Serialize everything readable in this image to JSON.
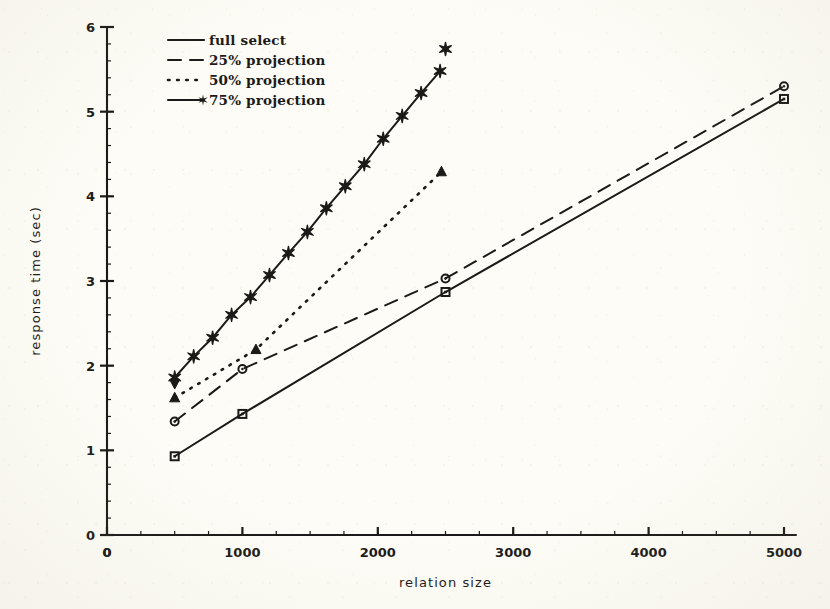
{
  "figure": {
    "background_color": "#fdfcf6",
    "ink_color": "#1c1a18"
  },
  "axes": {
    "x_label": "relation size",
    "y_label": "response time (sec)",
    "x_ticks": [
      "0",
      "1000",
      "2000",
      "3000",
      "4000",
      "5000"
    ],
    "y_ticks": [
      "0",
      "1",
      "2",
      "3",
      "4",
      "5",
      "6"
    ],
    "x_origin_label": "0",
    "y_origin_label": "0"
  },
  "legend": {
    "items": [
      {
        "label": "full select",
        "style": "solid",
        "marker": "none"
      },
      {
        "label": "25% projection",
        "style": "dashed",
        "marker": "none"
      },
      {
        "label": "50% projection",
        "style": "dotted",
        "marker": "none"
      },
      {
        "label": "75% projection",
        "style": "solid",
        "marker": "star"
      }
    ]
  },
  "chart_data": {
    "type": "line",
    "title": "",
    "xlabel": "relation size",
    "ylabel": "response time (sec)",
    "xlim": [
      0,
      5000
    ],
    "ylim": [
      0,
      6
    ],
    "xticks": [
      0,
      1000,
      2000,
      3000,
      4000,
      5000
    ],
    "yticks": [
      0,
      1,
      2,
      3,
      4,
      5,
      6
    ],
    "x_minor_tick_step": 250,
    "y_minor_tick_step": 0.2,
    "grid": false,
    "legend_position": "top-left",
    "series": [
      {
        "name": "full select",
        "line_style": "solid",
        "marker": "square",
        "x": [
          500,
          1000,
          2500,
          5000
        ],
        "y": [
          0.93,
          1.43,
          2.87,
          5.15
        ]
      },
      {
        "name": "25% projection",
        "line_style": "dashed",
        "marker": "circle",
        "x": [
          500,
          1000,
          2500,
          5000
        ],
        "y": [
          1.34,
          1.96,
          3.03,
          5.3
        ]
      },
      {
        "name": "50% projection",
        "line_style": "dotted",
        "marker": "triangle-up",
        "x": [
          500,
          1100,
          2470
        ],
        "y": [
          1.62,
          2.19,
          4.29
        ]
      },
      {
        "name": "75% projection",
        "line_style": "solid",
        "marker": "star",
        "x": [
          500,
          640,
          780,
          920,
          1060,
          1200,
          1340,
          1480,
          1620,
          1760,
          1900,
          2040,
          2180,
          2320,
          2460
        ],
        "y": [
          1.86,
          2.11,
          2.33,
          2.6,
          2.81,
          3.07,
          3.33,
          3.58,
          3.86,
          4.12,
          4.38,
          4.68,
          4.95,
          5.22,
          5.48
        ]
      },
      {
        "name": "75% projection start cap",
        "line_style": "none",
        "marker": "triangle-down",
        "x": [
          500
        ],
        "y": [
          1.79
        ]
      },
      {
        "name": "75% projection end cap",
        "line_style": "none",
        "marker": "star",
        "x": [
          2500
        ],
        "y": [
          5.74
        ]
      }
    ]
  }
}
